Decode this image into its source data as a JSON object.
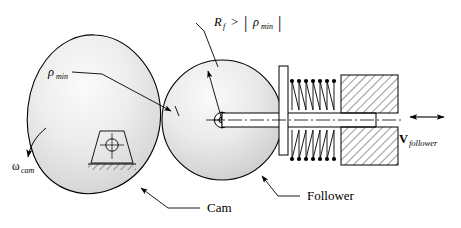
{
  "figure": {
    "background_color": "#ffffff",
    "line_color": "#000000",
    "body_fill_light": "#f2f2f2",
    "body_fill_mid": "#d8d8d8",
    "body_fill_dark": "#bdbdbd"
  },
  "labels": {
    "rf_condition": {
      "symbol": "R",
      "symbol_sub": "f",
      "relation": ">",
      "bar_left": "|",
      "rho": "ρ",
      "rho_sub": "min",
      "bar_right": "|",
      "full_text": "R_f > | ρ_min |"
    },
    "rho_min": {
      "symbol": "ρ",
      "subscript": "min",
      "full_text": "ρ_min"
    },
    "omega_cam": {
      "symbol": "ω",
      "subscript": "cam",
      "full_text": "ω_cam"
    },
    "v_follower": {
      "symbol": "V",
      "subscript": "follower",
      "full_text": "V_follower"
    },
    "cam": "Cam",
    "follower": "Follower"
  },
  "components": {
    "cam_body": "cam-ovoid",
    "roller_follower": "roller-circle",
    "pivot_ground": "ground-pivot-trapezoid",
    "roller_center": "roller-center-pin",
    "flange_plate": "spring-retainer-flange",
    "spring": "coil-spring",
    "housing": "hatched-bearing-housing",
    "push_rod": "follower-rod",
    "centerline": "axis-centerline"
  }
}
